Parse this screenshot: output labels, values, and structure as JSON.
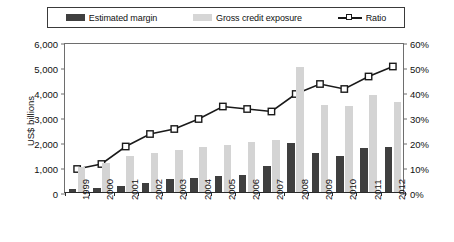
{
  "chart_data": {
    "type": "bar",
    "title": "",
    "subtitle": "",
    "xlabel": "",
    "ylabel": "US$ billions",
    "y2label": "",
    "categories": [
      "1999",
      "2000",
      "2001",
      "2002",
      "2003",
      "2004",
      "2005",
      "2006",
      "2007",
      "2008",
      "2009",
      "2010",
      "2011",
      "2012"
    ],
    "ylim": [
      0,
      6000
    ],
    "y2lim": [
      0,
      60
    ],
    "yticks": [
      "0",
      "1,000",
      "2,000",
      "3,000",
      "4,000",
      "5,000",
      "6,000"
    ],
    "ytick_values": [
      0,
      1000,
      2000,
      3000,
      4000,
      5000,
      6000
    ],
    "y2ticks": [
      "0%",
      "10%",
      "20%",
      "30%",
      "40%",
      "50%",
      "60%"
    ],
    "y2tick_values": [
      0,
      10,
      20,
      30,
      40,
      50,
      60
    ],
    "grid": false,
    "legend_position": "top",
    "series": [
      {
        "name": "Estimated margin",
        "type": "bar",
        "axis": "left",
        "color": "#3f3f3f",
        "values": [
          110,
          180,
          260,
          370,
          510,
          580,
          660,
          690,
          1050,
          1950,
          1560,
          1450,
          1780,
          1800
        ]
      },
      {
        "name": "Gross credit exposure",
        "type": "bar",
        "axis": "left",
        "color": "#d4d4d4",
        "values": [
          1000,
          1150,
          1450,
          1550,
          1700,
          1800,
          1900,
          2000,
          2100,
          5000,
          3500,
          3450,
          3900,
          3600
        ]
      },
      {
        "name": "Ratio",
        "type": "line",
        "axis": "right",
        "color": "#1a1a1a",
        "marker": "square",
        "values": [
          10,
          12,
          19,
          24,
          26,
          30,
          35,
          34,
          33,
          40,
          44,
          42,
          47,
          51
        ]
      }
    ]
  },
  "legend": {
    "items": [
      {
        "label": "Estimated margin",
        "swatch": "dark-bar-swatch"
      },
      {
        "label": "Gross credit exposure",
        "swatch": "light-bar-swatch"
      },
      {
        "label": "Ratio",
        "swatch": "line-marker-swatch"
      }
    ]
  }
}
